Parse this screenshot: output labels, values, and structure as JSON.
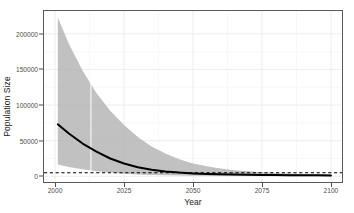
{
  "chart_data": {
    "type": "line",
    "title": "",
    "xlabel": "Year",
    "ylabel": "Population Size",
    "xlim": [
      1996,
      2104
    ],
    "ylim": [
      -8000,
      232000
    ],
    "xticks": [
      2000,
      2025,
      2050,
      2075,
      2100
    ],
    "xticklabels": [
      "2000",
      "2025",
      "2050",
      "2075",
      "2100"
    ],
    "yticks": [
      0,
      50000,
      100000,
      150000,
      200000
    ],
    "yticklabels": [
      "0",
      "50000",
      "100000",
      "150000",
      "200000"
    ],
    "grid": "major and minor white gridlines on white panel, panel border dark gray",
    "legend": "none",
    "series": [
      {
        "name": "Median projected population size",
        "style": "solid black line",
        "x": [
          2001,
          2005,
          2010,
          2015,
          2020,
          2025,
          2030,
          2035,
          2040,
          2045,
          2050,
          2055,
          2060,
          2065,
          2070,
          2075,
          2080,
          2085,
          2090,
          2095,
          2100
        ],
        "values": [
          73000,
          60000,
          46000,
          34500,
          25000,
          18000,
          12800,
          9200,
          6800,
          5200,
          4100,
          3400,
          2900,
          2500,
          2200,
          2000,
          1800,
          1600,
          1450,
          1300,
          1200
        ]
      },
      {
        "name": "95% credible interval upper bound",
        "style": "gray ribbon edge",
        "x": [
          2001,
          2005,
          2010,
          2015,
          2020,
          2025,
          2030,
          2035,
          2040,
          2045,
          2050,
          2055,
          2060,
          2065,
          2070,
          2075,
          2080,
          2085,
          2090,
          2095,
          2100
        ],
        "values": [
          223000,
          186000,
          148000,
          117000,
          92000,
          72000,
          55000,
          42000,
          32000,
          24000,
          18000,
          14000,
          11000,
          8500,
          7000,
          5800,
          4800,
          4000,
          3400,
          2900,
          2500
        ]
      },
      {
        "name": "95% credible interval lower bound",
        "style": "gray ribbon edge",
        "x": [
          2001,
          2005,
          2010,
          2015,
          2020,
          2025,
          2030,
          2035,
          2040,
          2045,
          2050,
          2055,
          2060,
          2065,
          2070,
          2075,
          2080,
          2085,
          2090,
          2095,
          2100
        ],
        "values": [
          16500,
          13000,
          9800,
          7200,
          5200,
          3700,
          2600,
          1900,
          1400,
          1050,
          800,
          620,
          500,
          400,
          330,
          280,
          240,
          210,
          185,
          165,
          150
        ]
      }
    ],
    "annotations": [
      {
        "name": "quasi-extinction-threshold",
        "type": "horizontal-dashed-line",
        "y": 5000,
        "style": "black dashed"
      },
      {
        "name": "reference-year-line",
        "type": "vertical-line",
        "x": 2013,
        "style": "white line inside ribbon"
      }
    ],
    "colors": {
      "ribbon_fill": "#b0b0b0",
      "line": "#000000",
      "dashed_line": "#000000",
      "panel_border": "#595959",
      "grid": "#f2f2f2",
      "tick_label": "#4d4d4d",
      "axis_title": "#1a1a1a",
      "background": "#ffffff"
    }
  }
}
